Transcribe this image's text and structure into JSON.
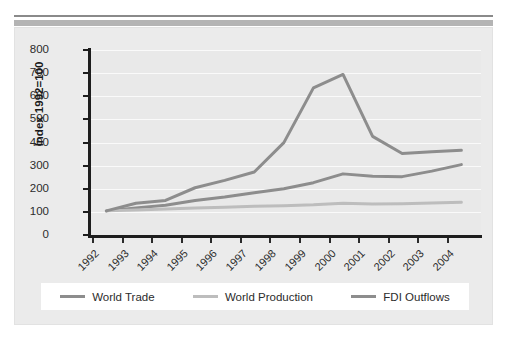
{
  "chart_data": {
    "type": "line",
    "title": "",
    "subtitle": "",
    "xlabel": "",
    "ylabel": "Index 1992=100",
    "x": [
      1992,
      1993,
      1994,
      1995,
      1996,
      1997,
      1998,
      1999,
      2000,
      2001,
      2002,
      2003,
      2004
    ],
    "categories": [
      "1992",
      "1993",
      "1994",
      "1995",
      "1996",
      "1997",
      "1998",
      "1999",
      "2000",
      "2001",
      "2002",
      "2003",
      "2004"
    ],
    "ylim": [
      0,
      800
    ],
    "yticks": [
      0,
      100,
      200,
      300,
      400,
      500,
      600,
      700,
      800
    ],
    "ytick_labels": [
      "0",
      "100",
      "200",
      "300",
      "400",
      "500",
      "600",
      "700",
      "800"
    ],
    "grid": "horizontal",
    "legend_position": "bottom",
    "series": [
      {
        "name": "World Trade",
        "color": "#8d8d8d",
        "values": [
          100,
          113,
          124,
          145,
          160,
          178,
          196,
          222,
          260,
          250,
          248,
          272,
          300
        ]
      },
      {
        "name": "World Production",
        "color": "#bdbdbd",
        "values": [
          100,
          104,
          108,
          112,
          116,
          120,
          122,
          126,
          133,
          130,
          131,
          134,
          137
        ]
      },
      {
        "name": "FDI Outflows",
        "color": "#8d8d8d",
        "values": [
          100,
          133,
          145,
          200,
          232,
          268,
          395,
          632,
          690,
          422,
          348,
          356,
          362
        ]
      }
    ]
  },
  "axis": {
    "y_title": "Index 1992=100"
  },
  "legend": {
    "items": [
      {
        "label": "World Trade",
        "color": "#8d8d8d"
      },
      {
        "label": "World Production",
        "color": "#bdbdbd"
      },
      {
        "label": "FDI Outflows",
        "color": "#8d8d8d"
      }
    ]
  }
}
